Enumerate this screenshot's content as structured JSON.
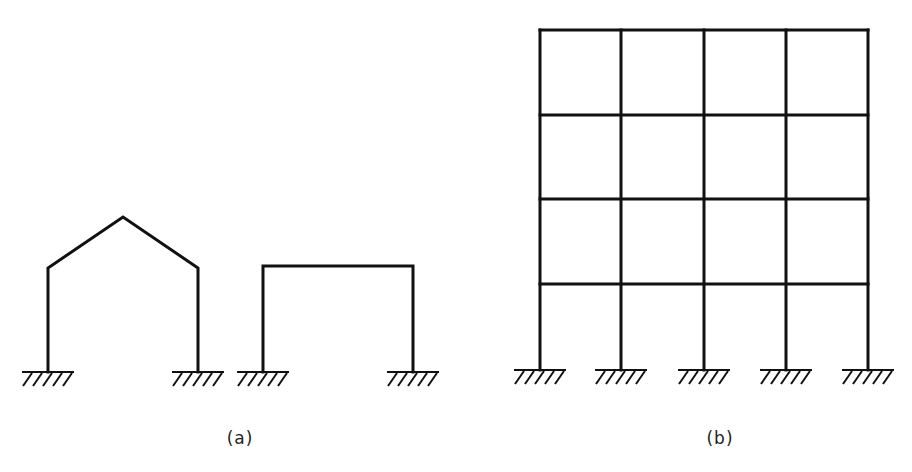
{
  "figure": {
    "background": "#ffffff",
    "line_color": "#111111",
    "panels": [
      {
        "id": "a",
        "label": "(a)",
        "label_pos": [
          240,
          428
        ],
        "frames": [
          {
            "type": "gable-frame",
            "columns": [
              48,
              198
            ],
            "eave_y": 268,
            "apex": [
              123,
              217
            ],
            "base_y": 372,
            "supports": "fixed"
          },
          {
            "type": "portal-frame",
            "columns": [
              263,
              413
            ],
            "beam_y": 266,
            "base_y": 372,
            "supports": "fixed"
          }
        ]
      },
      {
        "id": "b",
        "label": "(b)",
        "label_pos": [
          720,
          428
        ],
        "frames": [
          {
            "type": "multi-storey-frame",
            "bays": 4,
            "storeys": 4,
            "columns": [
              540,
              621,
              704,
              786,
              868
            ],
            "floors": [
              30,
              115,
              199,
              284
            ],
            "base_y": 370,
            "supports": "fixed"
          }
        ]
      }
    ]
  }
}
